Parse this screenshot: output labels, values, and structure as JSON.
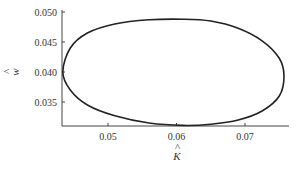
{
  "chart_data": {
    "type": "line",
    "title": "",
    "xlabel": "K̂",
    "ylabel": "ŵ",
    "xlim": [
      0.0433,
      0.0765
    ],
    "ylim": [
      0.031,
      0.05
    ],
    "grid": false,
    "legend": null,
    "x_ticks": [
      "0.05",
      "0.06",
      "0.07"
    ],
    "y_ticks": [
      "0.050",
      "0.045",
      "0.040",
      "0.035"
    ],
    "series": [
      {
        "name": "closed orbit",
        "closed": true,
        "x": [
          0.0434,
          0.0445,
          0.047,
          0.051,
          0.056,
          0.061,
          0.065,
          0.069,
          0.0725,
          0.075,
          0.0757,
          0.075,
          0.0725,
          0.069,
          0.065,
          0.061,
          0.056,
          0.051,
          0.047,
          0.0445,
          0.0434
        ],
        "y": [
          0.04,
          0.044,
          0.0465,
          0.048,
          0.0487,
          0.0488,
          0.0485,
          0.0473,
          0.0452,
          0.0423,
          0.0393,
          0.036,
          0.0335,
          0.032,
          0.0313,
          0.0311,
          0.0315,
          0.0327,
          0.0345,
          0.037,
          0.04
        ]
      }
    ]
  },
  "labels": {
    "x_axis": "K",
    "y_axis": "w",
    "hat": "^"
  }
}
